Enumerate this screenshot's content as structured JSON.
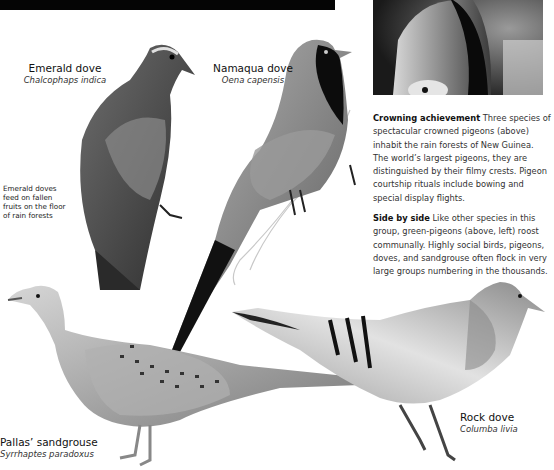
{
  "photo": {
    "subject": "crowned pigeon close-up",
    "description": "black-and-white photograph"
  },
  "birds": [
    {
      "id": "emerald-dove",
      "common": "Emerald dove",
      "latin": "Chalcophaps indica"
    },
    {
      "id": "namaqua-dove",
      "common": "Namaqua dove",
      "latin": "Oena capensis"
    },
    {
      "id": "pallas-sandgrouse",
      "common": "Pallas’ sandgrouse",
      "latin": "Syrrhaptes paradoxus"
    },
    {
      "id": "rock-dove",
      "common": "Rock dove",
      "latin": "Columba livia"
    }
  ],
  "notes": {
    "emerald_dove_note": "Emerald doves feed on fallen fruits on the floor of rain forests"
  },
  "captions": [
    {
      "heading": "Crowning achievement",
      "body": "Three species of spectacular crowned pigeons (above) inhabit the rain forests of New Guinea. The world’s largest pigeons, they are distinguished by their filmy crests. Pigeon courtship rituals include bowing and special display flights."
    },
    {
      "heading": "Side by side",
      "body": "Like other species in this group, green-pigeons (above, left) roost communally. Highly social birds, pigeons, doves, and sandgrouse often flock in very large groups numbering in the thousands."
    }
  ],
  "colors": {
    "bar": "#050505",
    "text": "#1a1a1a",
    "caption_text": "#333333"
  }
}
